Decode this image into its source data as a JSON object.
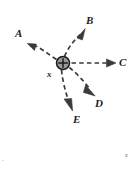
{
  "figure": {
    "width": 138,
    "height": 170,
    "background_color": "#ffffff",
    "stroke_color": "#3a3a3a",
    "charge": {
      "symbol": "+",
      "label": "x",
      "center_x": 63,
      "center_y": 63,
      "radius": 6.5,
      "fill_color": "#9a9a9a",
      "edge_color": "#1c1c1c"
    },
    "corner_marks": {
      "bottom_left": "·",
      "bottom_right": "x"
    },
    "vectors": [
      {
        "label": "A",
        "name": "trajectory-a",
        "direction": "upper-left",
        "curved": true,
        "label_x": 15,
        "label_y": 28,
        "arrow_tip_x": 28,
        "arrow_tip_y": 43
      },
      {
        "label": "B",
        "name": "trajectory-b",
        "direction": "upper-right",
        "curved": true,
        "label_x": 86,
        "label_y": 15,
        "arrow_tip_x": 84,
        "arrow_tip_y": 29
      },
      {
        "label": "C",
        "name": "trajectory-c",
        "direction": "right",
        "curved": false,
        "label_x": 119,
        "label_y": 57,
        "arrow_tip_x": 115,
        "arrow_tip_y": 63
      },
      {
        "label": "D",
        "name": "trajectory-d",
        "direction": "lower-right",
        "curved": true,
        "label_x": 95,
        "label_y": 98,
        "arrow_tip_x": 94,
        "arrow_tip_y": 95
      },
      {
        "label": "E",
        "name": "trajectory-e",
        "direction": "lower-left",
        "curved": true,
        "label_x": 73,
        "label_y": 114,
        "arrow_tip_x": 72,
        "arrow_tip_y": 110
      }
    ]
  }
}
